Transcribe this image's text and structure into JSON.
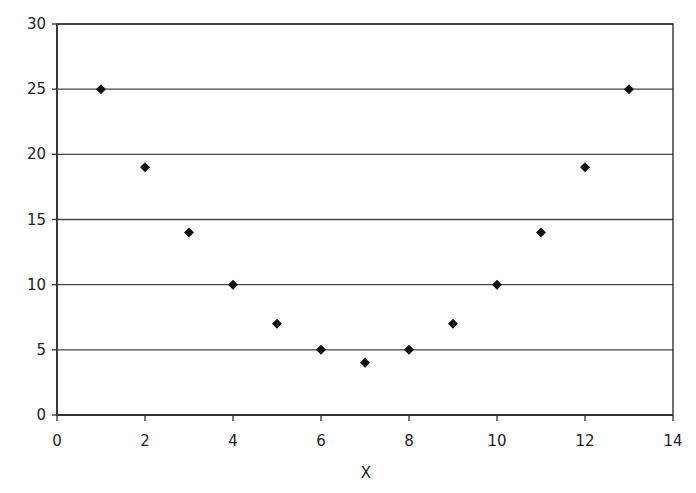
{
  "chart_data": {
    "type": "scatter",
    "title": "",
    "xlabel": "X",
    "ylabel": "",
    "xlim": [
      0,
      14
    ],
    "ylim": [
      0,
      30
    ],
    "xticks": [
      0,
      2,
      4,
      6,
      8,
      10,
      12,
      14
    ],
    "yticks": [
      0,
      5,
      10,
      15,
      20,
      25,
      30
    ],
    "grid": {
      "horizontal": true,
      "vertical": false
    },
    "legend": null,
    "marker": "diamond",
    "series": [
      {
        "name": "Series 1",
        "color": "#111111",
        "x": [
          1,
          2,
          3,
          4,
          5,
          6,
          7,
          8,
          9,
          10,
          11,
          12,
          13
        ],
        "y": [
          25,
          19,
          14,
          10,
          7,
          5,
          4,
          5,
          7,
          10,
          14,
          19,
          25
        ]
      }
    ]
  },
  "colors": {
    "axis": "#333333",
    "gridline": "#444444",
    "marker": "#111111",
    "background": "#ffffff"
  }
}
